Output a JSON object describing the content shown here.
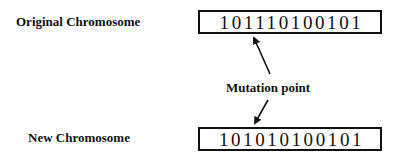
{
  "original": {
    "label": "Original Chromosome",
    "bits": "101110100101"
  },
  "new": {
    "label": "New Chromosome",
    "bits": "101010100101"
  },
  "annotation": {
    "label": "Mutation point",
    "bit_index": 3
  },
  "colors": {
    "ink": "#111111",
    "background": "#ffffff"
  }
}
